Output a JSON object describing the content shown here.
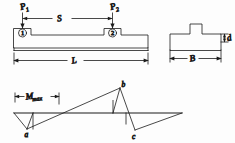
{
  "drawing": {
    "type": "engineering-beam-diagram",
    "line_color": "#1a1a1a",
    "background": "#fdfdfd",
    "views": [
      {
        "name": "side-elevation",
        "position": "top-left"
      },
      {
        "name": "cross-section",
        "position": "top-right"
      },
      {
        "name": "bending-moment-diagram",
        "position": "bottom"
      }
    ]
  },
  "beam_view": {
    "load_left": {
      "symbol": "P",
      "subscript": "1"
    },
    "load_right": {
      "symbol": "P",
      "subscript": "2"
    },
    "span_dimension": "S",
    "length_dimension": "L",
    "support_marker_left": "1",
    "support_marker_right": "2"
  },
  "section_view": {
    "thickness_dimension": "d",
    "width_dimension": "B"
  },
  "moment_diagram": {
    "max_moment_label": {
      "symbol": "M",
      "subscript": "max"
    },
    "points": [
      {
        "label": "a",
        "position": "below-baseline-left"
      },
      {
        "label": "b",
        "position": "above-baseline-right"
      },
      {
        "label": "c",
        "position": "below-baseline-right"
      }
    ]
  }
}
